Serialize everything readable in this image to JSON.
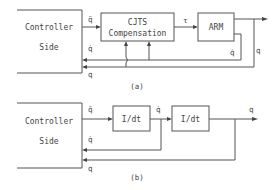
{
  "diagram_a": {
    "caption": "(a)",
    "controller": {
      "line1": "Controller",
      "line2": "Side"
    },
    "compensation": {
      "line1": "CJTS",
      "line2": "Compensation"
    },
    "plant": {
      "label": "ARM"
    },
    "signals": {
      "acc_cmd": "q̈",
      "torque": "τ",
      "vel_feedback": "q̇",
      "vel_feedback_right": "q̇",
      "pos_feedback": "q",
      "pos_feedback_right": "q"
    }
  },
  "diagram_b": {
    "caption": "(b)",
    "controller": {
      "line1": "Controller",
      "line2": "Side"
    },
    "integrator1": {
      "label": "I/dt"
    },
    "integrator2": {
      "label": "I/dt"
    },
    "signals": {
      "acc_cmd": "q̈",
      "velocity": "q̇",
      "vel_feedback": "q̇",
      "pos_output": "q",
      "pos_feedback": "q"
    }
  },
  "colors": {
    "line": "#555555",
    "text": "#444444",
    "background": "#ffffff"
  }
}
